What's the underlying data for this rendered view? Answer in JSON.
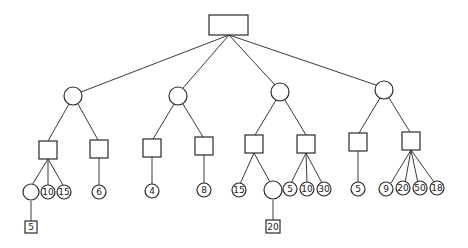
{
  "diagram": {
    "type": "tree",
    "root": {
      "shape": "rect",
      "label": ""
    },
    "branches": [
      {
        "node": {
          "shape": "circle",
          "label": ""
        },
        "children": [
          {
            "shape": "square",
            "label": "",
            "children": [
              {
                "shape": "circle",
                "label": "",
                "children": [
                  {
                    "shape": "square",
                    "label": "5"
                  }
                ]
              },
              {
                "shape": "circle",
                "label": "10"
              },
              {
                "shape": "circle",
                "label": "15"
              }
            ]
          },
          {
            "shape": "square",
            "label": "",
            "children": [
              {
                "shape": "circle",
                "label": "6"
              }
            ]
          }
        ]
      },
      {
        "node": {
          "shape": "circle",
          "label": ""
        },
        "children": [
          {
            "shape": "square",
            "label": "",
            "children": [
              {
                "shape": "circle",
                "label": "4"
              }
            ]
          },
          {
            "shape": "square",
            "label": "",
            "children": [
              {
                "shape": "circle",
                "label": "8"
              }
            ]
          }
        ]
      },
      {
        "node": {
          "shape": "circle",
          "label": ""
        },
        "children": [
          {
            "shape": "square",
            "label": "",
            "children": [
              {
                "shape": "circle",
                "label": "15"
              },
              {
                "shape": "circle",
                "label": "",
                "children": [
                  {
                    "shape": "square",
                    "label": "20"
                  }
                ]
              }
            ]
          },
          {
            "shape": "square",
            "label": "",
            "children": [
              {
                "shape": "circle",
                "label": "5"
              },
              {
                "shape": "circle",
                "label": "10"
              },
              {
                "shape": "circle",
                "label": "30"
              }
            ]
          }
        ]
      },
      {
        "node": {
          "shape": "circle",
          "label": ""
        },
        "children": [
          {
            "shape": "square",
            "label": "",
            "children": [
              {
                "shape": "circle",
                "label": "5"
              }
            ]
          },
          {
            "shape": "square",
            "label": "",
            "children": [
              {
                "shape": "circle",
                "label": "9"
              },
              {
                "shape": "circle",
                "label": "20"
              },
              {
                "shape": "circle",
                "label": "50"
              },
              {
                "shape": "circle",
                "label": "18"
              }
            ]
          }
        ]
      }
    ]
  },
  "leaf_labels": {
    "b1_s1_c2": "10",
    "b1_s1_c3": "15",
    "b1_s1_c1_sq": "5",
    "b1_s2_c1": "6",
    "b2_s1_c1": "4",
    "b2_s2_c1": "8",
    "b3_s1_c1": "15",
    "b3_s1_c2_sq": "20",
    "b3_s2_c1": "5",
    "b3_s2_c2": "10",
    "b3_s2_c3": "30",
    "b4_s1_c1": "5",
    "b4_s2_c1": "9",
    "b4_s2_c2": "20",
    "b4_s2_c3": "50",
    "b4_s2_c4": "18"
  }
}
